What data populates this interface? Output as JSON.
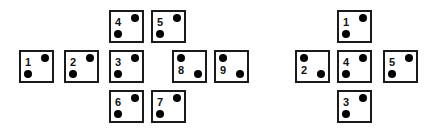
{
  "diagram": {
    "left_net": {
      "tiles": [
        {
          "label": "4",
          "orientation": "A",
          "x": 109,
          "y": 10
        },
        {
          "label": "5",
          "orientation": "A",
          "x": 151,
          "y": 10
        },
        {
          "label": "1",
          "orientation": "A",
          "x": 19,
          "y": 50
        },
        {
          "label": "2",
          "orientation": "A",
          "x": 64,
          "y": 50
        },
        {
          "label": "3",
          "orientation": "A",
          "x": 109,
          "y": 50
        },
        {
          "label": "8",
          "orientation": "B",
          "x": 172,
          "y": 50
        },
        {
          "label": "9",
          "orientation": "B",
          "x": 214,
          "y": 50
        },
        {
          "label": "6",
          "orientation": "A",
          "x": 109,
          "y": 90
        },
        {
          "label": "7",
          "orientation": "A",
          "x": 151,
          "y": 90
        }
      ]
    },
    "right_net": {
      "tiles": [
        {
          "label": "1",
          "orientation": "A",
          "x": 337,
          "y": 10
        },
        {
          "label": "2",
          "orientation": "B",
          "x": 295,
          "y": 50
        },
        {
          "label": "4",
          "orientation": "A",
          "x": 337,
          "y": 50
        },
        {
          "label": "5",
          "orientation": "A",
          "x": 383,
          "y": 50
        },
        {
          "label": "3",
          "orientation": "A",
          "x": 337,
          "y": 90
        }
      ]
    }
  }
}
